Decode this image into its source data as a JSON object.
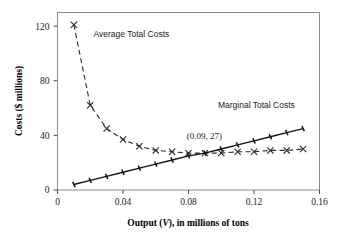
{
  "chart_data": {
    "type": "line",
    "title": "",
    "xlabel": "Output (V), in millions of tons",
    "xlabel_prefix": "Output (",
    "xlabel_italic": "V",
    "xlabel_suffix": "), in millions of tons",
    "ylabel": "Costs ($ millions)",
    "xlim": [
      0,
      0.16
    ],
    "ylim": [
      0,
      130
    ],
    "xticks": [
      0,
      0.04,
      0.08,
      0.12,
      0.16
    ],
    "xtick_labels": [
      "0",
      "0.04",
      "0.08",
      "0.12",
      "0.16"
    ],
    "yticks": [
      0,
      40,
      80,
      120
    ],
    "ytick_labels": [
      "0",
      "40",
      "80",
      "120"
    ],
    "grid": false,
    "legend_position": "inline-annotations",
    "annotations": [
      {
        "text": "Average Total Costs",
        "x": 0.022,
        "y": 112
      },
      {
        "text": "Marginal Total Costs",
        "x": 0.098,
        "y": 60
      },
      {
        "text": "(0.09, 27)",
        "x": 0.079,
        "y": 37
      }
    ],
    "series": [
      {
        "name": "Average Total Costs",
        "style": "dashed",
        "marker": "cross",
        "x": [
          0.01,
          0.02,
          0.03,
          0.04,
          0.05,
          0.06,
          0.07,
          0.08,
          0.09,
          0.1,
          0.11,
          0.12,
          0.13,
          0.14,
          0.15
        ],
        "values": [
          121,
          62,
          45,
          37,
          32,
          29,
          28,
          27,
          27,
          27,
          28,
          28,
          29,
          29,
          30
        ]
      },
      {
        "name": "Marginal Total Costs",
        "style": "solid",
        "marker": "tick",
        "x": [
          0.01,
          0.02,
          0.03,
          0.04,
          0.05,
          0.06,
          0.07,
          0.08,
          0.09,
          0.1,
          0.11,
          0.12,
          0.13,
          0.14,
          0.15
        ],
        "values": [
          4,
          7,
          10,
          13,
          16,
          19,
          22,
          25,
          27,
          30,
          33,
          36,
          39,
          42,
          45
        ]
      }
    ],
    "intersection_point": {
      "x": 0.09,
      "y": 27,
      "label": "(0.09, 27)"
    }
  },
  "colors": {
    "background": "#ffffff",
    "frame": "#8c8c8c",
    "average_total_costs": "#2b2b2b",
    "marginal_total_costs": "#111111",
    "text": "#1a1a1a"
  }
}
